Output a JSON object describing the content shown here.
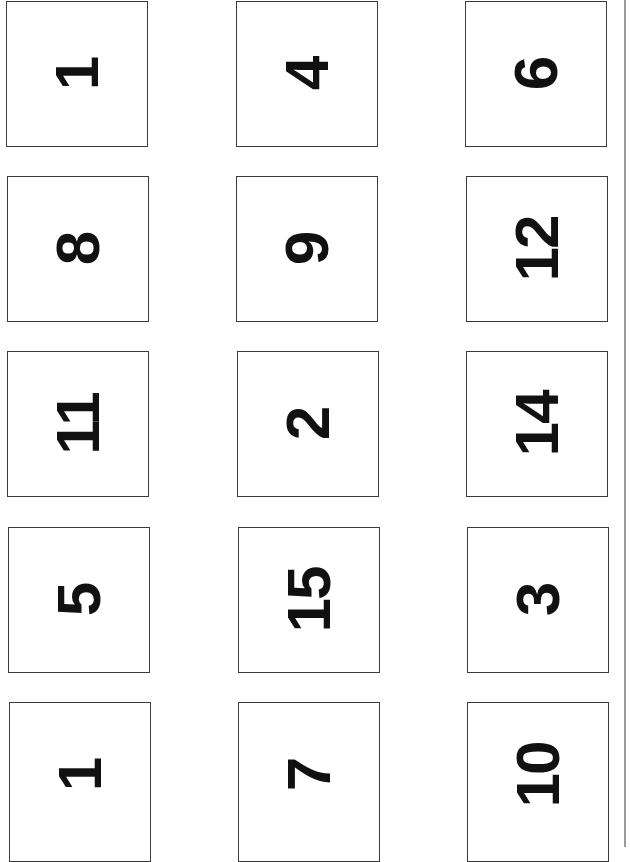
{
  "page": {
    "layout": {
      "columns": 3,
      "rows": 5,
      "orientation": "numbers rotated 90deg counter-clockwise"
    },
    "border_color": "#3a3a3a",
    "text_color": "#111111"
  },
  "cards": [
    {
      "value": "1",
      "row": 0,
      "col": 0,
      "x": 6,
      "y": 1
    },
    {
      "value": "4",
      "row": 0,
      "col": 1,
      "x": 236,
      "y": 1
    },
    {
      "value": "6",
      "row": 0,
      "col": 2,
      "x": 465,
      "y": 1
    },
    {
      "value": "8",
      "row": 1,
      "col": 0,
      "x": 7,
      "y": 176
    },
    {
      "value": "9",
      "row": 1,
      "col": 1,
      "x": 236,
      "y": 176
    },
    {
      "value": "12",
      "row": 1,
      "col": 2,
      "x": 466,
      "y": 176
    },
    {
      "value": "11",
      "row": 2,
      "col": 0,
      "x": 7,
      "y": 351
    },
    {
      "value": "2",
      "row": 2,
      "col": 1,
      "x": 237,
      "y": 351
    },
    {
      "value": "14",
      "row": 2,
      "col": 2,
      "x": 466,
      "y": 351
    },
    {
      "value": "5",
      "row": 3,
      "col": 0,
      "x": 8,
      "y": 527
    },
    {
      "value": "15",
      "row": 3,
      "col": 1,
      "x": 238,
      "y": 527
    },
    {
      "value": "3",
      "row": 3,
      "col": 2,
      "x": 467,
      "y": 527
    },
    {
      "value": "1",
      "row": 4,
      "col": 0,
      "x": 9,
      "y": 702
    },
    {
      "value": "7",
      "row": 4,
      "col": 1,
      "x": 238,
      "y": 702
    },
    {
      "value": "10",
      "row": 4,
      "col": 2,
      "x": 467,
      "y": 702
    }
  ]
}
